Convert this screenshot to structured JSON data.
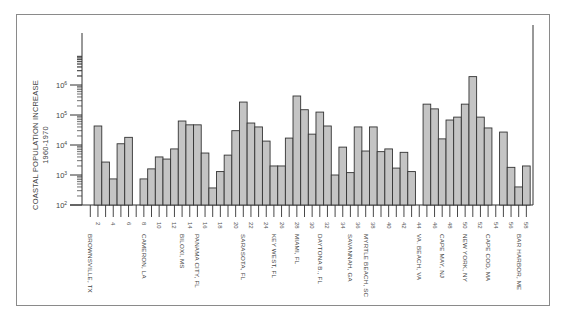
{
  "chart_data": {
    "type": "bar",
    "title": "",
    "ylabel": "COASTAL POPULATION INCREASE",
    "ylabel_sub": "1960-1970",
    "xlabel": "",
    "yscale": "log",
    "ylim": [
      100,
      10000000
    ],
    "ytick_labels": [
      "10^2",
      "10^3",
      "10^4",
      "10^5",
      "10^6"
    ],
    "grid": false,
    "legend": null,
    "slots": 58,
    "xtick_numbers": [
      2,
      4,
      6,
      8,
      10,
      12,
      14,
      16,
      18,
      20,
      22,
      24,
      26,
      28,
      30,
      32,
      34,
      36,
      38,
      40,
      42,
      44,
      46,
      48,
      50,
      52,
      54,
      56,
      58
    ],
    "categories": [
      1,
      2,
      3,
      4,
      5,
      6,
      7,
      8,
      9,
      10,
      11,
      12,
      13,
      14,
      15,
      16,
      17,
      18,
      19,
      20,
      21,
      22,
      23,
      24,
      25,
      26,
      27,
      28,
      29,
      30,
      31,
      32,
      33,
      34,
      35,
      36,
      37,
      38,
      39,
      40,
      41,
      42,
      43,
      44,
      45,
      46,
      47,
      48,
      49,
      50,
      51,
      52,
      53,
      54,
      55,
      56,
      57,
      58
    ],
    "values": [
      null,
      43000,
      2700,
      740,
      11000,
      18000,
      null,
      740,
      1600,
      4000,
      3400,
      7400,
      63000,
      47000,
      47000,
      5400,
      370,
      1300,
      4600,
      30000,
      270000,
      54000,
      40000,
      13500,
      2000,
      2000,
      17000,
      430000,
      150000,
      23000,
      125000,
      43000,
      1000,
      8500,
      1200,
      40000,
      6300,
      40000,
      6000,
      7400,
      1700,
      5700,
      1300,
      null,
      230000,
      160000,
      16000,
      68000,
      85000,
      230000,
      1900000,
      85000,
      37000,
      null,
      27000,
      1800,
      400,
      2000
    ],
    "city_labels": [
      {
        "slot": 1,
        "text": "BROWNSVILLE, TX"
      },
      {
        "slot": 8,
        "text": "CAMERON, LA"
      },
      {
        "slot": 13,
        "text": "BILOXI, MS"
      },
      {
        "slot": 15,
        "text": "PANAMA CITY, FL"
      },
      {
        "slot": 21,
        "text": "SARASOTA, FL"
      },
      {
        "slot": 25,
        "text": "KEY WEST, FL"
      },
      {
        "slot": 28,
        "text": "MIAMI, FL"
      },
      {
        "slot": 31,
        "text": "DAYTONA B., FL"
      },
      {
        "slot": 35,
        "text": "SAVANNAH, GA"
      },
      {
        "slot": 37,
        "text": "MYRTLE BEACH, SC"
      },
      {
        "slot": 44,
        "text": "VA. BEACH, VA"
      },
      {
        "slot": 47,
        "text": "CAPE MAY, NJ"
      },
      {
        "slot": 50,
        "text": "NEW YORK, NY"
      },
      {
        "slot": 53,
        "text": "CAPE COD, MA"
      },
      {
        "slot": 57,
        "text": "BAR HARBOR, ME"
      }
    ]
  },
  "colors": {
    "bar_fill": "#c4c4c4",
    "bar_stroke": "#333333",
    "frame": "#8a8a8a"
  }
}
